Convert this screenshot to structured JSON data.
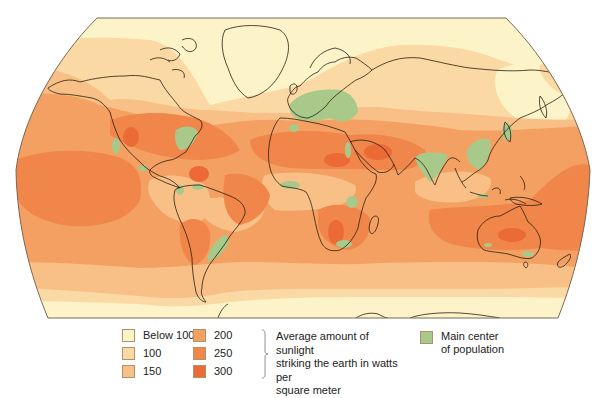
{
  "map": {
    "title": "World map of average sunlight striking the earth",
    "projection_outline": "robinson-like",
    "colors": {
      "below_100": "#fdf3c8",
      "100": "#fbd9a4",
      "150": "#f8c087",
      "200": "#f4a063",
      "250": "#f0864a",
      "300": "#eb6a35",
      "population": "#a9c98a",
      "coastline": "#2b1d10",
      "frame": "#7a6a5a"
    }
  },
  "legend": {
    "sunlight_levels": [
      {
        "label": "Below 100",
        "color": "#fdf3c8"
      },
      {
        "label": "100",
        "color": "#fbd9a4"
      },
      {
        "label": "150",
        "color": "#f8c087"
      },
      {
        "label": "200",
        "color": "#f4a063"
      },
      {
        "label": "250",
        "color": "#f0864a"
      },
      {
        "label": "300",
        "color": "#eb6a35"
      }
    ],
    "description_lines": [
      "Average amount of sunlight",
      "striking the earth in watts per",
      "square meter"
    ],
    "population": {
      "label_line1": "Main center",
      "label_line2": "of population",
      "color": "#a9c98a"
    }
  }
}
